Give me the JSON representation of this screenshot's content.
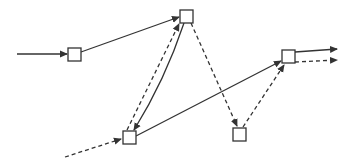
{
  "diagram": {
    "width": 350,
    "height": 168,
    "background": "#ffffff",
    "stroke_color": "#333333",
    "node_fill": "#ffffff",
    "node_size": 13,
    "nodes": [
      {
        "id": "A",
        "x": 68,
        "y": 48
      },
      {
        "id": "B",
        "x": 180,
        "y": 10
      },
      {
        "id": "C",
        "x": 123,
        "y": 131
      },
      {
        "id": "D",
        "x": 233,
        "y": 128
      },
      {
        "id": "E",
        "x": 282,
        "y": 50
      }
    ],
    "edges": [
      {
        "id": "in-solid",
        "from": "external",
        "to": "A",
        "style": "solid",
        "path": "M17,54 L67,54"
      },
      {
        "id": "A-B",
        "from": "A",
        "to": "B",
        "style": "solid",
        "path": "M81,52 L179,17"
      },
      {
        "id": "B-C",
        "from": "B",
        "to": "C",
        "style": "solid",
        "path": "M184,23 Q165,80 134,130"
      },
      {
        "id": "C-B",
        "from": "C",
        "to": "B",
        "style": "dashed",
        "path": "M127,130 L179,24"
      },
      {
        "id": "B-D",
        "from": "B",
        "to": "D",
        "style": "dashed",
        "path": "M191,23 L237,126"
      },
      {
        "id": "in-dashed",
        "from": "external",
        "to": "C",
        "style": "dashed",
        "path": "M65,157 L121,139"
      },
      {
        "id": "C-E",
        "from": "C",
        "to": "E",
        "style": "solid",
        "path": "M136,136 Q210,98 281,61"
      },
      {
        "id": "D-E",
        "from": "D",
        "to": "E",
        "style": "dashed",
        "path": "M243,127 L284,65"
      },
      {
        "id": "E-out-solid",
        "from": "E",
        "to": "external",
        "style": "solid",
        "path": "M295,52 L337,49"
      },
      {
        "id": "E-out-dashed",
        "from": "E",
        "to": "external",
        "style": "dashed",
        "path": "M295,62 L337,60"
      }
    ]
  }
}
